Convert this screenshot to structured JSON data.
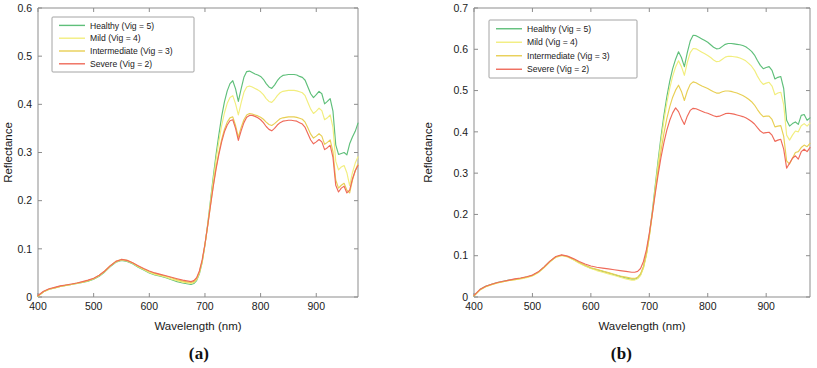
{
  "figure": {
    "panels": [
      {
        "id": "a",
        "caption": "(a)",
        "xlabel": "Wavelength (nm)",
        "ylabel": "Reflectance",
        "xticks": [
          "400",
          "500",
          "600",
          "700",
          "800",
          "900"
        ],
        "yticks": [
          "0",
          "0.1",
          "0.2",
          "0.3",
          "0.4",
          "0.5",
          "0.6"
        ],
        "legend": [
          "Healthy (Vig = 5)",
          "Mild (Vig = 4)",
          "Intermediate (Vig = 3)",
          "Severe (Vig = 2)"
        ]
      },
      {
        "id": "b",
        "caption": "(b)",
        "xlabel": "Wavelength (nm)",
        "ylabel": "Reflectance",
        "xticks": [
          "400",
          "500",
          "600",
          "700",
          "800",
          "900"
        ],
        "yticks": [
          "0",
          "0.1",
          "0.2",
          "0.3",
          "0.4",
          "0.5",
          "0.6",
          "0.7"
        ],
        "legend": [
          "Healthy (Vig = 5)",
          "Mild (Vig = 4)",
          "Intermediate (Vig = 3)",
          "Severe (Vig = 2)"
        ]
      }
    ],
    "colors": {
      "healthy": "#5fbf7a",
      "mild": "#f2ee7e",
      "intermediate": "#e8cf54",
      "severe": "#ef6a5a",
      "axis": "#8d8d8d",
      "text": "#1a1a1a"
    }
  },
  "chart_data": [
    {
      "type": "line",
      "panel": "a",
      "title": "",
      "xlabel": "Wavelength (nm)",
      "ylabel": "Reflectance",
      "xlim": [
        400,
        975
      ],
      "ylim": [
        0,
        0.6
      ],
      "xticks": [
        400,
        500,
        600,
        700,
        800,
        900
      ],
      "yticks": [
        0,
        0.1,
        0.2,
        0.3,
        0.4,
        0.5,
        0.6
      ],
      "grid": false,
      "legend_position": "upper left",
      "x": [
        400,
        410,
        420,
        430,
        440,
        450,
        460,
        470,
        480,
        490,
        500,
        510,
        520,
        530,
        540,
        550,
        560,
        570,
        580,
        590,
        600,
        610,
        620,
        630,
        640,
        650,
        660,
        670,
        675,
        680,
        685,
        690,
        695,
        700,
        705,
        710,
        715,
        720,
        725,
        730,
        735,
        740,
        745,
        750,
        755,
        760,
        765,
        770,
        775,
        780,
        785,
        790,
        795,
        800,
        805,
        810,
        815,
        820,
        825,
        830,
        835,
        840,
        845,
        850,
        855,
        860,
        865,
        870,
        875,
        880,
        885,
        890,
        895,
        900,
        905,
        910,
        915,
        920,
        925,
        930,
        935,
        940,
        945,
        950,
        955,
        960,
        965,
        970,
        975
      ],
      "series": [
        {
          "name": "Healthy (Vig = 5)",
          "color": "#5fbf7a",
          "values": [
            0.002,
            0.011,
            0.016,
            0.019,
            0.022,
            0.024,
            0.026,
            0.028,
            0.03,
            0.033,
            0.037,
            0.043,
            0.052,
            0.063,
            0.072,
            0.076,
            0.074,
            0.069,
            0.062,
            0.056,
            0.05,
            0.046,
            0.043,
            0.04,
            0.036,
            0.032,
            0.029,
            0.027,
            0.026,
            0.028,
            0.034,
            0.048,
            0.072,
            0.108,
            0.152,
            0.201,
            0.25,
            0.296,
            0.337,
            0.375,
            0.405,
            0.428,
            0.443,
            0.449,
            0.432,
            0.406,
            0.432,
            0.456,
            0.468,
            0.469,
            0.466,
            0.463,
            0.461,
            0.458,
            0.452,
            0.443,
            0.436,
            0.433,
            0.44,
            0.449,
            0.456,
            0.46,
            0.461,
            0.462,
            0.462,
            0.462,
            0.461,
            0.458,
            0.456,
            0.45,
            0.436,
            0.422,
            0.414,
            0.42,
            0.427,
            0.422,
            0.401,
            0.406,
            0.412,
            0.386,
            0.316,
            0.296,
            0.298,
            0.3,
            0.295,
            0.318,
            0.332,
            0.344,
            0.361
          ]
        },
        {
          "name": "Mild (Vig = 4)",
          "color": "#f2ee7e",
          "values": [
            0.002,
            0.011,
            0.016,
            0.019,
            0.022,
            0.024,
            0.026,
            0.028,
            0.031,
            0.034,
            0.038,
            0.044,
            0.053,
            0.064,
            0.073,
            0.077,
            0.075,
            0.07,
            0.063,
            0.057,
            0.051,
            0.047,
            0.044,
            0.041,
            0.037,
            0.034,
            0.031,
            0.029,
            0.028,
            0.03,
            0.036,
            0.05,
            0.073,
            0.108,
            0.15,
            0.197,
            0.243,
            0.286,
            0.323,
            0.356,
            0.382,
            0.402,
            0.414,
            0.418,
            0.401,
            0.378,
            0.403,
            0.425,
            0.436,
            0.438,
            0.436,
            0.433,
            0.43,
            0.426,
            0.42,
            0.412,
            0.406,
            0.404,
            0.41,
            0.418,
            0.424,
            0.427,
            0.428,
            0.429,
            0.429,
            0.429,
            0.428,
            0.426,
            0.424,
            0.418,
            0.404,
            0.39,
            0.381,
            0.386,
            0.392,
            0.387,
            0.368,
            0.372,
            0.378,
            0.352,
            0.282,
            0.264,
            0.27,
            0.273,
            0.258,
            0.231,
            0.258,
            0.278,
            0.291
          ]
        },
        {
          "name": "Intermediate (Vig = 3)",
          "color": "#e8cf54",
          "values": [
            0.002,
            0.011,
            0.016,
            0.019,
            0.022,
            0.024,
            0.026,
            0.029,
            0.031,
            0.034,
            0.038,
            0.045,
            0.054,
            0.065,
            0.074,
            0.078,
            0.076,
            0.071,
            0.064,
            0.058,
            0.053,
            0.049,
            0.046,
            0.043,
            0.04,
            0.036,
            0.033,
            0.031,
            0.03,
            0.032,
            0.038,
            0.052,
            0.075,
            0.109,
            0.148,
            0.191,
            0.232,
            0.269,
            0.3,
            0.327,
            0.348,
            0.363,
            0.372,
            0.374,
            0.356,
            0.332,
            0.352,
            0.368,
            0.378,
            0.381,
            0.38,
            0.378,
            0.376,
            0.373,
            0.369,
            0.363,
            0.358,
            0.356,
            0.36,
            0.365,
            0.37,
            0.372,
            0.373,
            0.374,
            0.374,
            0.374,
            0.373,
            0.371,
            0.369,
            0.363,
            0.351,
            0.338,
            0.33,
            0.334,
            0.339,
            0.334,
            0.317,
            0.321,
            0.326,
            0.302,
            0.243,
            0.226,
            0.232,
            0.236,
            0.222,
            0.216,
            0.242,
            0.262,
            0.276
          ]
        },
        {
          "name": "Severe (Vig = 2)",
          "color": "#ef6a5a",
          "values": [
            0.003,
            0.012,
            0.017,
            0.02,
            0.023,
            0.025,
            0.027,
            0.029,
            0.032,
            0.035,
            0.039,
            0.045,
            0.054,
            0.065,
            0.074,
            0.078,
            0.076,
            0.071,
            0.065,
            0.059,
            0.054,
            0.05,
            0.047,
            0.044,
            0.041,
            0.038,
            0.035,
            0.033,
            0.032,
            0.034,
            0.04,
            0.054,
            0.077,
            0.11,
            0.149,
            0.19,
            0.23,
            0.266,
            0.296,
            0.322,
            0.343,
            0.357,
            0.366,
            0.368,
            0.35,
            0.325,
            0.345,
            0.362,
            0.373,
            0.377,
            0.377,
            0.375,
            0.372,
            0.368,
            0.362,
            0.354,
            0.348,
            0.345,
            0.35,
            0.357,
            0.362,
            0.365,
            0.366,
            0.367,
            0.367,
            0.366,
            0.365,
            0.362,
            0.359,
            0.352,
            0.339,
            0.326,
            0.318,
            0.322,
            0.327,
            0.322,
            0.306,
            0.31,
            0.315,
            0.29,
            0.232,
            0.218,
            0.226,
            0.23,
            0.216,
            0.222,
            0.245,
            0.262,
            0.273
          ]
        }
      ]
    },
    {
      "type": "line",
      "panel": "b",
      "title": "",
      "xlabel": "Wavelength (nm)",
      "ylabel": "Reflectance",
      "xlim": [
        400,
        975
      ],
      "ylim": [
        0,
        0.7
      ],
      "xticks": [
        400,
        500,
        600,
        700,
        800,
        900
      ],
      "yticks": [
        0,
        0.1,
        0.2,
        0.3,
        0.4,
        0.5,
        0.6,
        0.7
      ],
      "grid": false,
      "legend_position": "upper left",
      "x": [
        400,
        410,
        420,
        430,
        440,
        450,
        460,
        470,
        480,
        490,
        500,
        510,
        520,
        530,
        540,
        550,
        560,
        570,
        580,
        590,
        600,
        610,
        620,
        630,
        640,
        650,
        660,
        670,
        675,
        680,
        685,
        690,
        695,
        700,
        705,
        710,
        715,
        720,
        725,
        730,
        735,
        740,
        745,
        750,
        755,
        760,
        765,
        770,
        775,
        780,
        785,
        790,
        795,
        800,
        805,
        810,
        815,
        820,
        825,
        830,
        835,
        840,
        845,
        850,
        855,
        860,
        865,
        870,
        875,
        880,
        885,
        890,
        895,
        900,
        905,
        910,
        915,
        920,
        925,
        930,
        935,
        940,
        945,
        950,
        955,
        960,
        965,
        970,
        975
      ],
      "series": [
        {
          "name": "Healthy (Vig = 5)",
          "color": "#5fbf7a",
          "values": [
            0.003,
            0.018,
            0.026,
            0.031,
            0.035,
            0.038,
            0.041,
            0.043,
            0.045,
            0.048,
            0.052,
            0.06,
            0.072,
            0.086,
            0.097,
            0.101,
            0.098,
            0.091,
            0.083,
            0.076,
            0.07,
            0.066,
            0.062,
            0.058,
            0.054,
            0.05,
            0.046,
            0.043,
            0.043,
            0.046,
            0.054,
            0.072,
            0.104,
            0.15,
            0.206,
            0.268,
            0.33,
            0.388,
            0.44,
            0.485,
            0.523,
            0.553,
            0.576,
            0.594,
            0.58,
            0.558,
            0.592,
            0.62,
            0.634,
            0.633,
            0.629,
            0.625,
            0.621,
            0.617,
            0.611,
            0.605,
            0.601,
            0.602,
            0.607,
            0.612,
            0.614,
            0.614,
            0.613,
            0.612,
            0.611,
            0.609,
            0.606,
            0.601,
            0.595,
            0.586,
            0.573,
            0.561,
            0.553,
            0.556,
            0.558,
            0.549,
            0.528,
            0.532,
            0.534,
            0.505,
            0.428,
            0.414,
            0.42,
            0.424,
            0.418,
            0.44,
            0.442,
            0.428,
            0.434
          ]
        },
        {
          "name": "Mild (Vig = 4)",
          "color": "#f2ee7e",
          "values": [
            0.003,
            0.017,
            0.025,
            0.03,
            0.034,
            0.037,
            0.04,
            0.042,
            0.044,
            0.047,
            0.051,
            0.059,
            0.071,
            0.085,
            0.096,
            0.1,
            0.097,
            0.09,
            0.082,
            0.075,
            0.069,
            0.064,
            0.06,
            0.056,
            0.052,
            0.048,
            0.044,
            0.041,
            0.041,
            0.044,
            0.052,
            0.07,
            0.101,
            0.146,
            0.201,
            0.261,
            0.321,
            0.377,
            0.427,
            0.47,
            0.506,
            0.535,
            0.557,
            0.572,
            0.558,
            0.537,
            0.568,
            0.592,
            0.602,
            0.601,
            0.597,
            0.593,
            0.589,
            0.585,
            0.58,
            0.574,
            0.57,
            0.571,
            0.576,
            0.581,
            0.583,
            0.583,
            0.582,
            0.581,
            0.579,
            0.576,
            0.572,
            0.566,
            0.559,
            0.549,
            0.535,
            0.523,
            0.515,
            0.518,
            0.52,
            0.511,
            0.49,
            0.494,
            0.496,
            0.466,
            0.392,
            0.38,
            0.392,
            0.402,
            0.4,
            0.415,
            0.42,
            0.414,
            0.421
          ]
        },
        {
          "name": "Intermediate (Vig = 3)",
          "color": "#e8cf54",
          "values": [
            0.003,
            0.017,
            0.025,
            0.03,
            0.034,
            0.037,
            0.04,
            0.042,
            0.045,
            0.048,
            0.052,
            0.06,
            0.072,
            0.086,
            0.097,
            0.101,
            0.098,
            0.092,
            0.084,
            0.077,
            0.071,
            0.067,
            0.063,
            0.059,
            0.055,
            0.051,
            0.048,
            0.045,
            0.045,
            0.048,
            0.056,
            0.074,
            0.104,
            0.147,
            0.198,
            0.253,
            0.306,
            0.354,
            0.396,
            0.432,
            0.461,
            0.484,
            0.501,
            0.513,
            0.498,
            0.476,
            0.499,
            0.515,
            0.521,
            0.519,
            0.515,
            0.511,
            0.508,
            0.505,
            0.501,
            0.497,
            0.494,
            0.494,
            0.497,
            0.499,
            0.499,
            0.498,
            0.496,
            0.494,
            0.491,
            0.488,
            0.484,
            0.479,
            0.473,
            0.465,
            0.454,
            0.444,
            0.437,
            0.438,
            0.438,
            0.43,
            0.412,
            0.414,
            0.415,
            0.389,
            0.33,
            0.322,
            0.336,
            0.35,
            0.352,
            0.362,
            0.368,
            0.364,
            0.372
          ]
        },
        {
          "name": "Severe (Vig = 2)",
          "color": "#ef6a5a",
          "values": [
            0.004,
            0.018,
            0.026,
            0.031,
            0.035,
            0.038,
            0.041,
            0.044,
            0.046,
            0.049,
            0.053,
            0.061,
            0.073,
            0.087,
            0.098,
            0.102,
            0.099,
            0.093,
            0.086,
            0.08,
            0.075,
            0.072,
            0.07,
            0.068,
            0.066,
            0.064,
            0.062,
            0.06,
            0.06,
            0.062,
            0.069,
            0.086,
            0.114,
            0.154,
            0.2,
            0.249,
            0.296,
            0.338,
            0.374,
            0.404,
            0.428,
            0.446,
            0.458,
            0.449,
            0.432,
            0.418,
            0.438,
            0.452,
            0.457,
            0.456,
            0.453,
            0.45,
            0.447,
            0.445,
            0.442,
            0.439,
            0.437,
            0.438,
            0.441,
            0.444,
            0.445,
            0.444,
            0.443,
            0.441,
            0.439,
            0.437,
            0.434,
            0.43,
            0.425,
            0.419,
            0.41,
            0.402,
            0.397,
            0.398,
            0.399,
            0.392,
            0.377,
            0.38,
            0.382,
            0.358,
            0.312,
            0.324,
            0.336,
            0.342,
            0.334,
            0.352,
            0.358,
            0.352,
            0.362
          ]
        }
      ]
    }
  ]
}
